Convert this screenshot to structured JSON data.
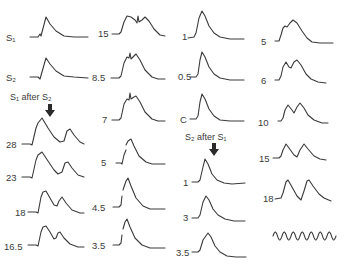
{
  "figure": {
    "columns": [
      {
        "id": "col1",
        "header": null,
        "traces": [
          {
            "label": "S₁",
            "shape": "single"
          },
          {
            "label": "S₂",
            "shape": "single"
          }
        ],
        "subheader": "S₁ after S₂",
        "subtraces": [
          {
            "label": "28",
            "shape": "double-wide"
          },
          {
            "label": "23",
            "shape": "double-mid"
          },
          {
            "label": "18",
            "shape": "double-close"
          },
          {
            "label": "16.5",
            "shape": "double-closer"
          }
        ]
      },
      {
        "id": "col2",
        "traces": [
          {
            "label": "15",
            "shape": "fused-notch"
          },
          {
            "label": "8.5",
            "shape": "fused"
          },
          {
            "label": "7",
            "shape": "fused"
          },
          {
            "label": "5",
            "shape": "single-notch"
          },
          {
            "label": "4.5",
            "shape": "single-notch"
          },
          {
            "label": "3.5",
            "shape": "single-notch"
          }
        ]
      },
      {
        "id": "col3",
        "traces": [
          {
            "label": "1",
            "shape": "single"
          },
          {
            "label": "0.5",
            "shape": "single"
          },
          {
            "label": "C",
            "shape": "single"
          }
        ],
        "subheader": "S₂ after S₁",
        "subtraces": [
          {
            "label": "1",
            "shape": "single"
          },
          {
            "label": "3",
            "shape": "single"
          },
          {
            "label": "3.5",
            "shape": "single-small"
          }
        ]
      },
      {
        "id": "col4",
        "traces": [
          {
            "label": "5",
            "shape": "fused-shoulder"
          },
          {
            "label": "6",
            "shape": "double-close"
          },
          {
            "label": "10",
            "shape": "double-mid"
          },
          {
            "label": "15",
            "shape": "double-wide"
          },
          {
            "label": "18",
            "shape": "double-wider"
          }
        ],
        "calibration": {
          "label": "",
          "cycles": 7
        }
      }
    ]
  }
}
